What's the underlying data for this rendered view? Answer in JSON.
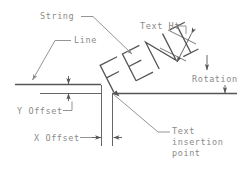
{
  "diagram": {
    "colors": {
      "geometry": "#555555",
      "leader": "#888888",
      "label_text": "#8a8a8a",
      "background": "#ffffff"
    },
    "sample_text": "FENI",
    "labels": {
      "string": "String",
      "line": "Line",
      "text_height": "Text Ht",
      "rotation": "Rotation",
      "y_offset": "Y Offset",
      "x_offset": "X Offset",
      "insertion_line_1": "Text",
      "insertion_line_2": "insertion",
      "insertion_line_3": "point"
    },
    "geometry_notes": {
      "text_rotation_degrees": -27,
      "baseline_y": 93,
      "line_y": 84,
      "insertion_point_x": 112,
      "insertion_point_y": 93
    }
  }
}
